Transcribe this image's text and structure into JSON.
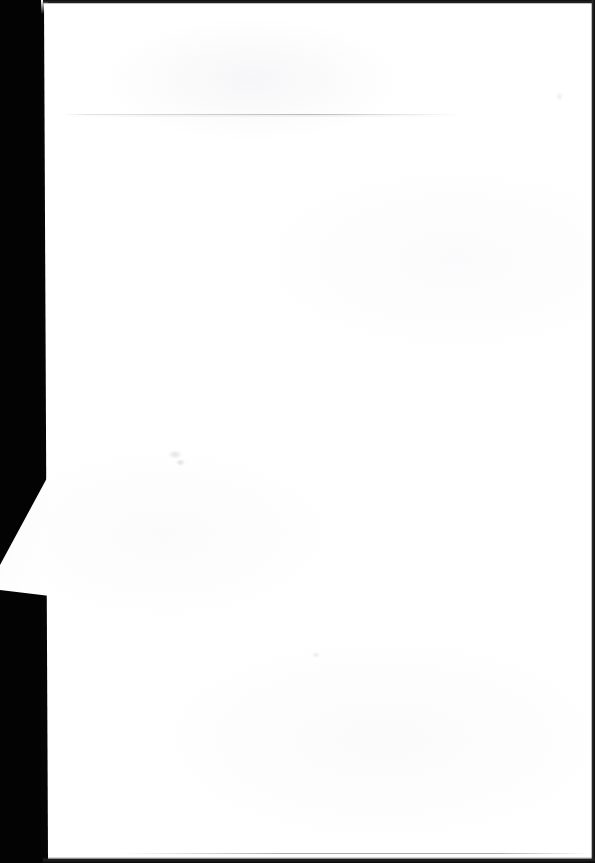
{
  "document": {
    "kind": "scanned-page",
    "title": "Scanned blank page",
    "page_body_text": "",
    "orientation": "portrait",
    "width_px": 595,
    "height_px": 863
  },
  "colors": {
    "scanner_bed": "#030303",
    "paper": "#ffffff",
    "paper_shade": "#f6f6f8",
    "fold_line": "#b2b2ba",
    "scan_edge": "#111111",
    "smudge": "#cec8ce"
  },
  "regions": {
    "scanner_bed_left": {
      "label": "Scanner bed margin",
      "description": "Black unexposed strip along the left side of the scan"
    },
    "paper_sheet": {
      "label": "Paper sheet",
      "description": "Blank white page occupying most of the frame"
    },
    "fold_line": {
      "label": "Fold line",
      "description": "Faint horizontal crease near the top of the page"
    },
    "lifted_corner": {
      "label": "Lifted page corner",
      "description": "White triangular corner of an underlying sheet protruding into the black margin"
    },
    "smudges": {
      "label": "Surface smudges",
      "description": "Very faint marks on the paper surface"
    }
  },
  "edges": {
    "top": "Top scan edge",
    "right": "Right scan edge",
    "bottom": "Bottom scan edge"
  }
}
